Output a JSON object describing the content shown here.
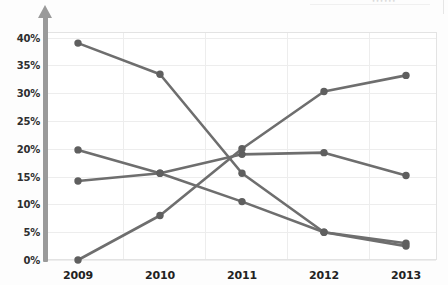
{
  "chart_data": {
    "type": "line",
    "title": "",
    "subtitle": "",
    "xlabel": "",
    "ylabel": "",
    "categories": [
      "2009",
      "2010",
      "2011",
      "2012",
      "2013"
    ],
    "x_tick_labels": [
      "2009",
      "2010",
      "2011",
      "2012",
      "2013"
    ],
    "y_tick_labels": [
      "0%",
      "5%",
      "10%",
      "15%",
      "20%",
      "25%",
      "30%",
      "35%",
      "40%"
    ],
    "y_tick_values": [
      0,
      5,
      10,
      15,
      20,
      25,
      30,
      35,
      40
    ],
    "ylim": [
      0,
      41
    ],
    "y_unit": "%",
    "grid": true,
    "legend": "none",
    "marker": "circle",
    "series": [
      {
        "name": "series-1",
        "color": "#6e6e6e",
        "values": [
          39.0,
          33.4,
          15.6,
          5.0,
          2.5
        ]
      },
      {
        "name": "series-2",
        "color": "#6e6e6e",
        "values": [
          19.8,
          15.6,
          19.0,
          19.3,
          15.2
        ]
      },
      {
        "name": "series-3",
        "color": "#6e6e6e",
        "values": [
          14.2,
          15.6,
          10.5,
          5.0,
          3.0
        ]
      },
      {
        "name": "series-4",
        "color": "#6e6e6e",
        "values": [
          0.0,
          8.0,
          20.0,
          30.3,
          33.2
        ]
      }
    ]
  },
  "axis": {
    "y_arrow_color": "#9a9a9a",
    "gridline_color": "#ededed",
    "plot_border_color": "#e3e3e3",
    "tick_label_color": "#2e2e2e"
  },
  "artifacts": {
    "top_residue_text": "••••••"
  }
}
